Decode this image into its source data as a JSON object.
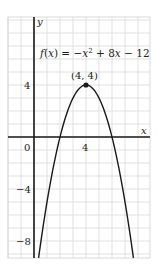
{
  "chart_data": {
    "type": "line",
    "title": "",
    "function_label": "f(x) = −x² + 8x − 12",
    "function_label_parts": {
      "f": "f",
      "open": "(",
      "x": "x",
      "close": ")",
      "eq": " = −",
      "x2": "x",
      "sup": "2",
      "plus": " + 8",
      "x3": "x",
      "minus": " − 12"
    },
    "xlabel": "x",
    "ylabel": "y",
    "xlim": [
      -2,
      8.9
    ],
    "ylim": [
      -9.3,
      9.2
    ],
    "grid": true,
    "x_ticks": [
      {
        "value": 0,
        "label": "0"
      },
      {
        "value": 4,
        "label": "4"
      }
    ],
    "y_ticks": [
      {
        "value": 4,
        "label": "4"
      },
      {
        "value": -4,
        "label": "−4"
      },
      {
        "value": -8,
        "label": "−8"
      }
    ],
    "series": [
      {
        "name": "f(x) = -x^2 + 8x - 12",
        "x": [
          0.35,
          1,
          2,
          3,
          4,
          5,
          6,
          7,
          7.65
        ],
        "values": [
          -9.3,
          -5,
          0,
          3,
          4,
          3,
          0,
          -5,
          -9.3
        ]
      }
    ],
    "annotations": [
      {
        "label": "(4, 4)",
        "x": 4,
        "y": 4,
        "marker": "dot"
      }
    ]
  },
  "labels": {
    "y_axis": "y",
    "x_axis": "x",
    "origin": "0",
    "xtick4": "4",
    "ytick4": "4",
    "ytickm4": "−4",
    "ytickm8": "−8",
    "vertex": "(4, 4)"
  },
  "colors": {
    "grid": "#d9d9d9",
    "axis": "#1a1a1a",
    "curve": "#1a1a1a",
    "frame": "#cfcfcf"
  }
}
